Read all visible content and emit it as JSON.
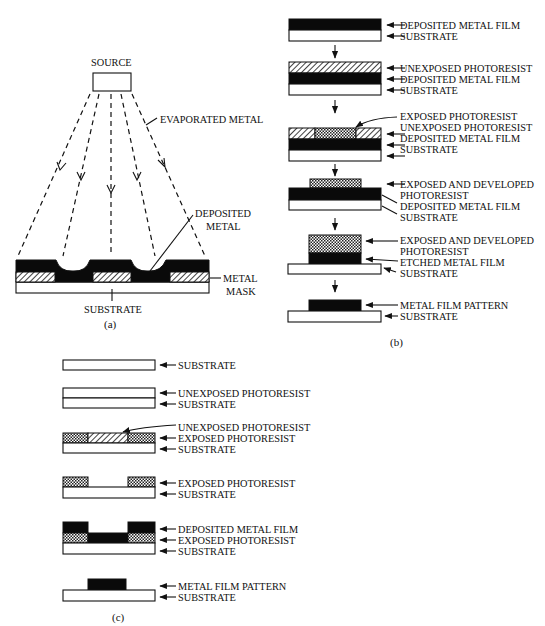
{
  "figure": {
    "panels": [
      {
        "id": "a",
        "caption": "(a)",
        "title": "Evaporation through metal mask",
        "labels": {
          "source": "SOURCE",
          "evaporated_metal": "EVAPORATED METAL",
          "deposited_metal_1": "DEPOSITED",
          "deposited_metal_2": "METAL",
          "metal_mask_1": "METAL",
          "metal_mask_2": "MASK",
          "substrate": "SUBSTRATE"
        }
      },
      {
        "id": "b",
        "caption": "(b)",
        "title": "Subtractive patterning (etching)",
        "steps": [
          {
            "labels": [
              "DEPOSITED METAL FILM",
              "SUBSTRATE"
            ]
          },
          {
            "labels": [
              "UNEXPOSED PHOTORESIST",
              "DEPOSITED METAL FILM",
              "SUBSTRATE"
            ]
          },
          {
            "labels": [
              "EXPOSED PHOTORESIST",
              "UNEXPOSED PHOTORESIST",
              "DEPOSITED METAL FILM",
              "SUBSTRATE"
            ]
          },
          {
            "labels": [
              "EXPOSED AND DEVELOPED",
              "PHOTORESIST",
              "DEPOSITED METAL FILM",
              "SUBSTRATE"
            ]
          },
          {
            "labels": [
              "EXPOSED AND DEVELOPED",
              "PHOTORESIST",
              "ETCHED METAL FILM",
              "SUBSTRATE"
            ]
          },
          {
            "labels": [
              "METAL FILM PATTERN",
              "SUBSTRATE"
            ]
          }
        ]
      },
      {
        "id": "c",
        "caption": "(c)",
        "title": "Lift-off patterning",
        "steps": [
          {
            "labels": [
              "SUBSTRATE"
            ]
          },
          {
            "labels": [
              "UNEXPOSED PHOTORESIST",
              "SUBSTRATE"
            ]
          },
          {
            "labels": [
              "UNEXPOSED PHOTORESIST",
              "EXPOSED PHOTORESIST",
              "SUBSTRATE"
            ]
          },
          {
            "labels": [
              "EXPOSED PHOTORESIST",
              "SUBSTRATE"
            ]
          },
          {
            "labels": [
              "DEPOSITED METAL FILM",
              "EXPOSED PHOTORESIST",
              "SUBSTRATE"
            ]
          },
          {
            "labels": [
              "METAL FILM PATTERN",
              "SUBSTRATE"
            ]
          }
        ]
      }
    ],
    "colors": {
      "ink": "#111111",
      "metal": "#0a0a0a",
      "background": "#ffffff"
    }
  }
}
